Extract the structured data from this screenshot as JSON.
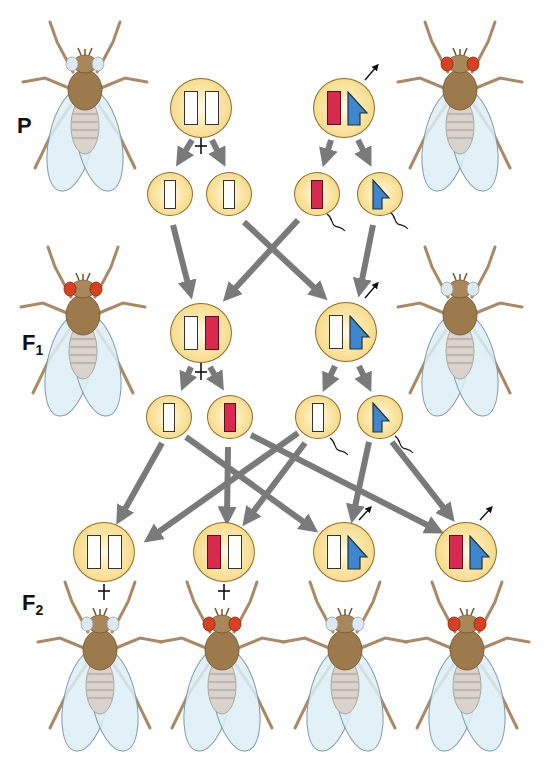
{
  "diagram": {
    "generations": [
      {
        "id": "P",
        "label": "P",
        "sub": ""
      },
      {
        "id": "F1",
        "label": "F",
        "sub": "1"
      },
      {
        "id": "F2",
        "label": "F",
        "sub": "2"
      }
    ],
    "symbols": {
      "female": "+",
      "male_arrow": "→"
    },
    "colors": {
      "cell_fill": "#f3cf72",
      "cell_border": "#8a6f2a",
      "x_normal": "#ffffff",
      "x_red_eye_allele": "#d8294f",
      "y_chromosome": "#3f86d1",
      "arrow": "#7a7a7a",
      "red_eye": "#d9401f",
      "white_eye": "#dde9ee",
      "fly_body": "#9c7a4c",
      "wing": "#dceef6"
    },
    "flies": [
      {
        "id": "p-female",
        "generation": "P",
        "sex": "female",
        "eye": "white"
      },
      {
        "id": "p-male",
        "generation": "P",
        "sex": "male",
        "eye": "white"
      },
      {
        "id": "f1-female",
        "generation": "F1",
        "sex": "female",
        "eye": "red"
      },
      {
        "id": "f1-male",
        "generation": "F1",
        "sex": "male",
        "eye": "white"
      },
      {
        "id": "f2-1",
        "generation": "F2",
        "sex": "female",
        "eye": "white"
      },
      {
        "id": "f2-2",
        "generation": "F2",
        "sex": "female",
        "eye": "red"
      },
      {
        "id": "f2-3",
        "generation": "F2",
        "sex": "male",
        "eye": "white"
      },
      {
        "id": "f2-4",
        "generation": "F2",
        "sex": "male",
        "eye": "red"
      }
    ],
    "cells": [
      {
        "id": "p-female-cell",
        "chromosomes": [
          "X",
          "X"
        ]
      },
      {
        "id": "p-male-cell",
        "chromosomes": [
          "X-red",
          "Y"
        ]
      },
      {
        "id": "p-egg-1",
        "chromosomes": [
          "X"
        ]
      },
      {
        "id": "p-egg-2",
        "chromosomes": [
          "X"
        ]
      },
      {
        "id": "p-sperm-1",
        "chromosomes": [
          "X-red"
        ]
      },
      {
        "id": "p-sperm-2",
        "chromosomes": [
          "Y"
        ]
      },
      {
        "id": "f1-female-cell",
        "chromosomes": [
          "X",
          "X-red"
        ]
      },
      {
        "id": "f1-male-cell",
        "chromosomes": [
          "X",
          "Y"
        ]
      },
      {
        "id": "f1-egg-1",
        "chromosomes": [
          "X"
        ]
      },
      {
        "id": "f1-egg-2",
        "chromosomes": [
          "X-red"
        ]
      },
      {
        "id": "f1-sperm-1",
        "chromosomes": [
          "X"
        ]
      },
      {
        "id": "f1-sperm-2",
        "chromosomes": [
          "Y"
        ]
      },
      {
        "id": "f2-cell-1",
        "chromosomes": [
          "X",
          "X"
        ]
      },
      {
        "id": "f2-cell-2",
        "chromosomes": [
          "X-red",
          "X"
        ]
      },
      {
        "id": "f2-cell-3",
        "chromosomes": [
          "X",
          "Y"
        ]
      },
      {
        "id": "f2-cell-4",
        "chromosomes": [
          "X-red",
          "Y"
        ]
      }
    ]
  }
}
